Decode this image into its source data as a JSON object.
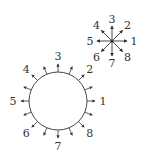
{
  "diagram": {
    "star": {
      "center": [
        112,
        41
      ],
      "arm_length": 15,
      "labels": [
        {
          "text": "1",
          "angle": 0
        },
        {
          "text": "2",
          "angle": 45
        },
        {
          "text": "3",
          "angle": 90
        },
        {
          "text": "4",
          "angle": 135
        },
        {
          "text": "5",
          "angle": 180
        },
        {
          "text": "6",
          "angle": 225
        },
        {
          "text": "7",
          "angle": 270
        },
        {
          "text": "8",
          "angle": 315
        }
      ]
    },
    "circle": {
      "center": [
        58,
        101
      ],
      "radius": 29,
      "arrow_count": 16,
      "arrow_length": 8,
      "labels": [
        {
          "text": "1",
          "angle": 0
        },
        {
          "text": "2",
          "angle": 45
        },
        {
          "text": "3",
          "angle": 90
        },
        {
          "text": "4",
          "angle": 135
        },
        {
          "text": "5",
          "angle": 180
        },
        {
          "text": "6",
          "angle": 225
        },
        {
          "text": "7",
          "angle": 270
        },
        {
          "text": "8",
          "angle": 315
        }
      ]
    },
    "colors": {
      "stroke": "#333333",
      "background": "#ffffff"
    }
  }
}
